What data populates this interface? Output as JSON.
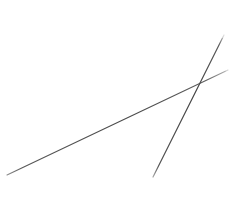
{
  "canvas": {
    "width": 230,
    "height": 208,
    "background_color": "#ffffff",
    "description": "Two thin dark gray straight lines crossing on a plain white background"
  },
  "chart_data": {
    "type": "line",
    "title": "",
    "subtitle": "",
    "xlabel": "",
    "ylabel": "",
    "xlim": [
      0,
      230
    ],
    "ylim": [
      0,
      208
    ],
    "grid": false,
    "axes_visible": false,
    "tick_labels_x": [],
    "tick_labels_y": [],
    "legend": false,
    "legend_position": "none",
    "annotations": [],
    "background_color": "#ffffff",
    "series": [
      {
        "name": "shallow-line",
        "color": "#4f4f4f",
        "stroke_width": 1.1,
        "points": [
          {
            "x": 7,
            "y": 175
          },
          {
            "x": 117,
            "y": 123
          },
          {
            "x": 199,
            "y": 82
          },
          {
            "x": 228,
            "y": 70
          }
        ],
        "slope": -0.475,
        "start_point": {
          "x": 7,
          "y": 175
        },
        "end_point": {
          "x": 228,
          "y": 70
        }
      },
      {
        "name": "steep-line",
        "color": "#4a4a4a",
        "stroke_width": 1.2,
        "points": [
          {
            "x": 153,
            "y": 177
          },
          {
            "x": 169,
            "y": 150
          },
          {
            "x": 180,
            "y": 125
          },
          {
            "x": 199,
            "y": 82
          },
          {
            "x": 224,
            "y": 35
          }
        ],
        "slope": -2.0,
        "start_point": {
          "x": 153,
          "y": 177
        },
        "end_point": {
          "x": 224,
          "y": 35
        }
      }
    ],
    "intersection": {
      "x": 199,
      "y": 82
    }
  }
}
